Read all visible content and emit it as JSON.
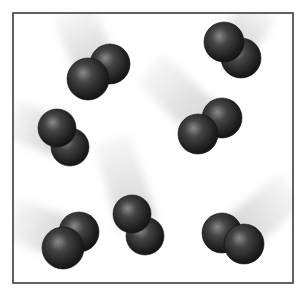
{
  "figure": {
    "background": "#ffffff",
    "container": {
      "x": 13,
      "y": 13,
      "width": 280,
      "height": 270,
      "stroke": "#3a3a3a",
      "stroke_width": 1.6
    },
    "sphere_colors": {
      "highlight": "#8a8a8a",
      "mid": "#444444",
      "dark": "#1c1c1c",
      "edge": "#141414"
    },
    "trail_color": "#c8c8c8",
    "molecules": [
      {
        "id": "molecule-1",
        "atoms": [
          {
            "cx": 110,
            "cy": 64,
            "r": 20
          },
          {
            "cx": 88,
            "cy": 79,
            "r": 21
          }
        ],
        "trail": {
          "from": [
            72,
            12
          ],
          "to": [
            99,
            72
          ],
          "width": 44
        }
      },
      {
        "id": "molecule-2",
        "atoms": [
          {
            "cx": 241,
            "cy": 58,
            "r": 20
          },
          {
            "cx": 224,
            "cy": 42,
            "r": 20
          }
        ],
        "trail": {
          "from": [
            262,
            8
          ],
          "to": [
            232,
            50
          ],
          "width": 40
        }
      },
      {
        "id": "molecule-3",
        "atoms": [
          {
            "cx": 222,
            "cy": 118,
            "r": 20
          },
          {
            "cx": 198,
            "cy": 134,
            "r": 20
          }
        ],
        "trail": {
          "from": [
            150,
            68
          ],
          "to": [
            210,
            126
          ],
          "width": 42
        }
      },
      {
        "id": "molecule-4",
        "atoms": [
          {
            "cx": 70,
            "cy": 147,
            "r": 19
          },
          {
            "cx": 57,
            "cy": 128,
            "r": 19
          }
        ],
        "trail": {
          "from": [
            10,
            118
          ],
          "to": [
            62,
            138
          ],
          "width": 40
        }
      },
      {
        "id": "molecule-5",
        "atoms": [
          {
            "cx": 79,
            "cy": 232,
            "r": 20
          },
          {
            "cx": 63,
            "cy": 248,
            "r": 21
          }
        ],
        "trail": {
          "from": [
            10,
            218
          ],
          "to": [
            70,
            240
          ],
          "width": 44
        }
      },
      {
        "id": "molecule-6",
        "atoms": [
          {
            "cx": 145,
            "cy": 236,
            "r": 19
          },
          {
            "cx": 132,
            "cy": 214,
            "r": 19
          }
        ],
        "trail": {
          "from": [
            112,
            140
          ],
          "to": [
            138,
            224
          ],
          "width": 40
        }
      },
      {
        "id": "molecule-7",
        "atoms": [
          {
            "cx": 222,
            "cy": 233,
            "r": 20
          },
          {
            "cx": 244,
            "cy": 244,
            "r": 20
          }
        ],
        "trail": {
          "from": [
            292,
            188
          ],
          "to": [
            234,
            238
          ],
          "width": 42
        }
      }
    ]
  }
}
